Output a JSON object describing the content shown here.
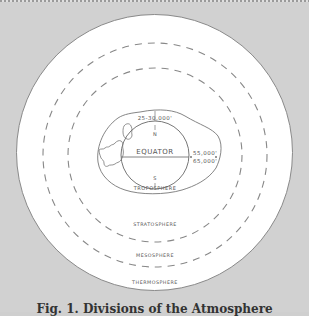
{
  "figure": {
    "labels": {
      "altitude_polar": "25-30,000'",
      "north": "N",
      "equator": "EQUATOR",
      "south": "S",
      "altitude_equatorial_1": "55,000'",
      "altitude_equatorial_2": "65,000'",
      "troposphere": "TROPOSPHERE",
      "stratosphere": "STRATOSPHERE",
      "mesosphere": "MESOSPHERE",
      "thermosphere": "THERMOSPHERE"
    },
    "layers": [
      "TROPOSPHERE",
      "STRATOSPHERE",
      "MESOSPHERE",
      "THERMOSPHERE"
    ],
    "caption": "Fig. 1. Divisions of the Atmosphere",
    "colors": {
      "background": "#d1d1d1",
      "disk": "#ffffff",
      "lines": "#777777",
      "text": "#555555"
    }
  }
}
